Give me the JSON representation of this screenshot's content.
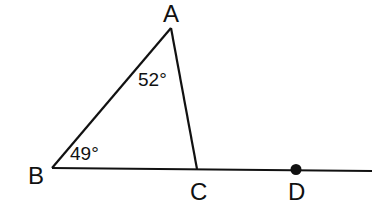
{
  "diagram": {
    "points": {
      "A": {
        "label": "A"
      },
      "B": {
        "label": "B"
      },
      "C": {
        "label": "C"
      },
      "D": {
        "label": "D"
      }
    },
    "angles": {
      "A": {
        "label": "52°",
        "value": 52
      },
      "B": {
        "label": "49°",
        "value": 49
      }
    },
    "colors": {
      "stroke": "#111111",
      "background": "#ffffff"
    }
  }
}
